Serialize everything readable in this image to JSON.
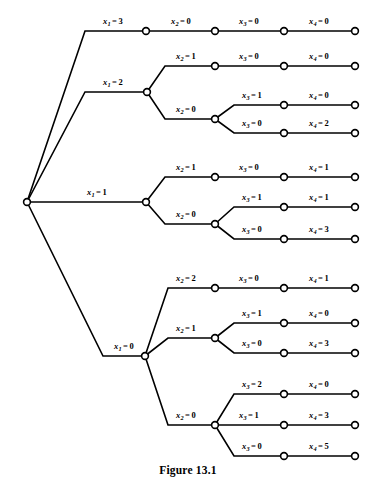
{
  "figure": {
    "caption": "Figure 13.1",
    "line_color": "#000000",
    "background_color": "#ffffff",
    "node_fill": "#ffffff"
  },
  "tree": {
    "root": {
      "id": "root",
      "x": 27,
      "y": 202
    },
    "levels": [
      {
        "name": "x1",
        "variable": "x",
        "subscript": "1"
      },
      {
        "name": "x2",
        "variable": "x",
        "subscript": "2"
      },
      {
        "name": "x3",
        "variable": "x",
        "subscript": "3"
      },
      {
        "name": "x4",
        "variable": "x",
        "subscript": "4"
      }
    ],
    "nodes": [
      {
        "id": "root",
        "x": 27,
        "y": 202,
        "level": 0
      },
      {
        "id": "n1-3",
        "x": 146,
        "y": 31,
        "level": 1
      },
      {
        "id": "n1-2",
        "x": 147,
        "y": 92,
        "level": 1
      },
      {
        "id": "n1-1",
        "x": 146,
        "y": 202,
        "level": 1
      },
      {
        "id": "n1-0",
        "x": 145,
        "y": 356,
        "level": 1
      },
      {
        "id": "n2-a",
        "x": 215,
        "y": 31,
        "level": 2
      },
      {
        "id": "n2-b",
        "x": 215,
        "y": 66,
        "level": 2
      },
      {
        "id": "n2-c",
        "x": 215,
        "y": 119,
        "level": 2
      },
      {
        "id": "n2-d",
        "x": 215,
        "y": 177,
        "level": 2
      },
      {
        "id": "n2-e",
        "x": 215,
        "y": 224,
        "level": 2
      },
      {
        "id": "n2-f",
        "x": 215,
        "y": 288,
        "level": 2
      },
      {
        "id": "n2-g",
        "x": 215,
        "y": 338,
        "level": 2
      },
      {
        "id": "n2-h",
        "x": 215,
        "y": 425,
        "level": 2
      },
      {
        "id": "n3-a",
        "x": 284,
        "y": 31,
        "level": 3
      },
      {
        "id": "n3-b",
        "x": 284,
        "y": 66,
        "level": 3
      },
      {
        "id": "n3-c",
        "x": 284,
        "y": 105,
        "level": 3
      },
      {
        "id": "n3-d",
        "x": 284,
        "y": 133,
        "level": 3
      },
      {
        "id": "n3-e",
        "x": 284,
        "y": 177,
        "level": 3
      },
      {
        "id": "n3-f",
        "x": 284,
        "y": 207,
        "level": 3
      },
      {
        "id": "n3-g",
        "x": 284,
        "y": 239,
        "level": 3
      },
      {
        "id": "n3-h",
        "x": 284,
        "y": 288,
        "level": 3
      },
      {
        "id": "n3-i",
        "x": 284,
        "y": 323,
        "level": 3
      },
      {
        "id": "n3-j",
        "x": 284,
        "y": 353,
        "level": 3
      },
      {
        "id": "n3-k",
        "x": 284,
        "y": 394,
        "level": 3
      },
      {
        "id": "n3-l",
        "x": 284,
        "y": 425,
        "level": 3
      },
      {
        "id": "n3-m",
        "x": 284,
        "y": 456,
        "level": 3
      },
      {
        "id": "n4-a",
        "x": 355,
        "y": 31,
        "level": 4
      },
      {
        "id": "n4-b",
        "x": 355,
        "y": 66,
        "level": 4
      },
      {
        "id": "n4-c",
        "x": 355,
        "y": 105,
        "level": 4
      },
      {
        "id": "n4-d",
        "x": 355,
        "y": 133,
        "level": 4
      },
      {
        "id": "n4-e",
        "x": 355,
        "y": 177,
        "level": 4
      },
      {
        "id": "n4-f",
        "x": 355,
        "y": 207,
        "level": 4
      },
      {
        "id": "n4-g",
        "x": 355,
        "y": 239,
        "level": 4
      },
      {
        "id": "n4-h",
        "x": 355,
        "y": 288,
        "level": 4
      },
      {
        "id": "n4-i",
        "x": 355,
        "y": 323,
        "level": 4
      },
      {
        "id": "n4-j",
        "x": 355,
        "y": 353,
        "level": 4
      },
      {
        "id": "n4-k",
        "x": 355,
        "y": 394,
        "level": 4
      },
      {
        "id": "n4-l",
        "x": 355,
        "y": 425,
        "level": 4
      },
      {
        "id": "n4-m",
        "x": 355,
        "y": 456,
        "level": 4
      }
    ],
    "edges": [
      {
        "id": "e-root-x1-3",
        "path": "M27,202 L85,31 L146,31",
        "label": {
          "variable": "x",
          "subscript": "1",
          "value": "3",
          "x": 113,
          "y": 22
        }
      },
      {
        "id": "e-root-x1-2",
        "path": "M27,202 L85,92 L147,92",
        "label": {
          "variable": "x",
          "subscript": "1",
          "value": "2",
          "x": 113,
          "y": 83
        }
      },
      {
        "id": "e-root-x1-1",
        "path": "M27,202 L146,202",
        "label": {
          "variable": "x",
          "subscript": "1",
          "value": "1",
          "x": 97,
          "y": 193
        }
      },
      {
        "id": "e-root-x1-0",
        "path": "M27,202 L103,356 L145,356",
        "label": {
          "variable": "x",
          "subscript": "1",
          "value": "0",
          "x": 124,
          "y": 347
        }
      },
      {
        "id": "e-x1-3-x2-0",
        "path": "M146,31 L215,31",
        "label": {
          "variable": "x",
          "subscript": "2",
          "value": "0",
          "x": 181,
          "y": 22
        }
      },
      {
        "id": "e-x1-2-x2-1",
        "path": "M147,92 L165,66 L215,66",
        "label": {
          "variable": "x",
          "subscript": "2",
          "value": "1",
          "x": 186,
          "y": 57
        }
      },
      {
        "id": "e-x1-2-x2-0",
        "path": "M147,92 L165,119 L215,119",
        "label": {
          "variable": "x",
          "subscript": "2",
          "value": "0",
          "x": 186,
          "y": 110
        }
      },
      {
        "id": "e-x1-1-x2-1",
        "path": "M146,202 L165,177 L215,177",
        "label": {
          "variable": "x",
          "subscript": "2",
          "value": "1",
          "x": 186,
          "y": 168
        }
      },
      {
        "id": "e-x1-1-x2-0",
        "path": "M146,202 L165,224 L215,224",
        "label": {
          "variable": "x",
          "subscript": "2",
          "value": "0",
          "x": 186,
          "y": 215
        }
      },
      {
        "id": "e-x1-0-x2-2",
        "path": "M145,356 L168,288 L215,288",
        "label": {
          "variable": "x",
          "subscript": "2",
          "value": "2",
          "x": 186,
          "y": 279
        }
      },
      {
        "id": "e-x1-0-x2-1",
        "path": "M145,356 L168,338 L215,338",
        "label": {
          "variable": "x",
          "subscript": "2",
          "value": "1",
          "x": 186,
          "y": 329
        }
      },
      {
        "id": "e-x1-0-x2-0",
        "path": "M145,356 L168,425 L215,425",
        "label": {
          "variable": "x",
          "subscript": "2",
          "value": "0",
          "x": 186,
          "y": 416
        }
      },
      {
        "id": "e-a-x3-0",
        "path": "M215,31 L284,31",
        "label": {
          "variable": "x",
          "subscript": "3",
          "value": "0",
          "x": 249,
          "y": 22
        }
      },
      {
        "id": "e-b-x3-0",
        "path": "M215,66 L284,66",
        "label": {
          "variable": "x",
          "subscript": "3",
          "value": "0",
          "x": 249,
          "y": 57
        }
      },
      {
        "id": "e-c-x3-1",
        "path": "M215,119 L234,105 L284,105",
        "label": {
          "variable": "x",
          "subscript": "3",
          "value": "1",
          "x": 252,
          "y": 96
        }
      },
      {
        "id": "e-c-x3-0",
        "path": "M215,119 L234,133 L284,133",
        "label": {
          "variable": "x",
          "subscript": "3",
          "value": "0",
          "x": 252,
          "y": 124
        }
      },
      {
        "id": "e-d-x3-0",
        "path": "M215,177 L284,177",
        "label": {
          "variable": "x",
          "subscript": "3",
          "value": "0",
          "x": 249,
          "y": 168
        }
      },
      {
        "id": "e-e-x3-1",
        "path": "M215,224 L234,207 L284,207",
        "label": {
          "variable": "x",
          "subscript": "3",
          "value": "1",
          "x": 252,
          "y": 198
        }
      },
      {
        "id": "e-e-x3-0",
        "path": "M215,224 L234,239 L284,239",
        "label": {
          "variable": "x",
          "subscript": "3",
          "value": "0",
          "x": 252,
          "y": 230
        }
      },
      {
        "id": "e-f-x3-0",
        "path": "M215,288 L284,288",
        "label": {
          "variable": "x",
          "subscript": "3",
          "value": "0",
          "x": 249,
          "y": 279
        }
      },
      {
        "id": "e-g-x3-1",
        "path": "M215,338 L234,323 L284,323",
        "label": {
          "variable": "x",
          "subscript": "3",
          "value": "1",
          "x": 252,
          "y": 314
        }
      },
      {
        "id": "e-g-x3-0",
        "path": "M215,338 L234,353 L284,353",
        "label": {
          "variable": "x",
          "subscript": "3",
          "value": "0",
          "x": 252,
          "y": 344
        }
      },
      {
        "id": "e-h-x3-2",
        "path": "M215,425 L234,394 L284,394",
        "label": {
          "variable": "x",
          "subscript": "3",
          "value": "2",
          "x": 252,
          "y": 385
        }
      },
      {
        "id": "e-h-x3-1",
        "path": "M215,425 L284,425",
        "label": {
          "variable": "x",
          "subscript": "3",
          "value": "1",
          "x": 249,
          "y": 416
        }
      },
      {
        "id": "e-h-x3-0",
        "path": "M215,425 L234,456 L284,456",
        "label": {
          "variable": "x",
          "subscript": "3",
          "value": "0",
          "x": 252,
          "y": 447
        }
      },
      {
        "id": "e-leaf-a",
        "path": "M284,31 L355,31",
        "label": {
          "variable": "x",
          "subscript": "4",
          "value": "0",
          "x": 319,
          "y": 22
        }
      },
      {
        "id": "e-leaf-b",
        "path": "M284,66 L355,66",
        "label": {
          "variable": "x",
          "subscript": "4",
          "value": "0",
          "x": 319,
          "y": 57
        }
      },
      {
        "id": "e-leaf-c",
        "path": "M284,105 L355,105",
        "label": {
          "variable": "x",
          "subscript": "4",
          "value": "0",
          "x": 319,
          "y": 96
        }
      },
      {
        "id": "e-leaf-d",
        "path": "M284,133 L355,133",
        "label": {
          "variable": "x",
          "subscript": "4",
          "value": "2",
          "x": 319,
          "y": 124
        }
      },
      {
        "id": "e-leaf-e",
        "path": "M284,177 L355,177",
        "label": {
          "variable": "x",
          "subscript": "4",
          "value": "1",
          "x": 319,
          "y": 168
        }
      },
      {
        "id": "e-leaf-f",
        "path": "M284,207 L355,207",
        "label": {
          "variable": "x",
          "subscript": "4",
          "value": "1",
          "x": 319,
          "y": 198
        }
      },
      {
        "id": "e-leaf-g",
        "path": "M284,239 L355,239",
        "label": {
          "variable": "x",
          "subscript": "4",
          "value": "3",
          "x": 319,
          "y": 230
        }
      },
      {
        "id": "e-leaf-h",
        "path": "M284,288 L355,288",
        "label": {
          "variable": "x",
          "subscript": "4",
          "value": "1",
          "x": 319,
          "y": 279
        }
      },
      {
        "id": "e-leaf-i",
        "path": "M284,323 L355,323",
        "label": {
          "variable": "x",
          "subscript": "4",
          "value": "0",
          "x": 319,
          "y": 314
        }
      },
      {
        "id": "e-leaf-j",
        "path": "M284,353 L355,353",
        "label": {
          "variable": "x",
          "subscript": "4",
          "value": "3",
          "x": 319,
          "y": 344
        }
      },
      {
        "id": "e-leaf-k",
        "path": "M284,394 L355,394",
        "label": {
          "variable": "x",
          "subscript": "4",
          "value": "0",
          "x": 319,
          "y": 385
        }
      },
      {
        "id": "e-leaf-l",
        "path": "M284,425 L355,425",
        "label": {
          "variable": "x",
          "subscript": "4",
          "value": "3",
          "x": 319,
          "y": 416
        }
      },
      {
        "id": "e-leaf-m",
        "path": "M284,456 L355,456",
        "label": {
          "variable": "x",
          "subscript": "4",
          "value": "5",
          "x": 319,
          "y": 447
        }
      }
    ],
    "paths_enumerated": [
      {
        "x1": "3",
        "x2": "0",
        "x3": "0",
        "x4": "0"
      },
      {
        "x1": "2",
        "x2": "1",
        "x3": "0",
        "x4": "0"
      },
      {
        "x1": "2",
        "x2": "0",
        "x3": "1",
        "x4": "0"
      },
      {
        "x1": "2",
        "x2": "0",
        "x3": "0",
        "x4": "2"
      },
      {
        "x1": "1",
        "x2": "1",
        "x3": "0",
        "x4": "1"
      },
      {
        "x1": "1",
        "x2": "0",
        "x3": "1",
        "x4": "1"
      },
      {
        "x1": "1",
        "x2": "0",
        "x3": "0",
        "x4": "3"
      },
      {
        "x1": "0",
        "x2": "2",
        "x3": "0",
        "x4": "1"
      },
      {
        "x1": "0",
        "x2": "1",
        "x3": "1",
        "x4": "0"
      },
      {
        "x1": "0",
        "x2": "1",
        "x3": "0",
        "x4": "3"
      },
      {
        "x1": "0",
        "x2": "0",
        "x3": "2",
        "x4": "0"
      },
      {
        "x1": "0",
        "x2": "0",
        "x3": "1",
        "x4": "3"
      },
      {
        "x1": "0",
        "x2": "0",
        "x3": "0",
        "x4": "5"
      }
    ]
  }
}
